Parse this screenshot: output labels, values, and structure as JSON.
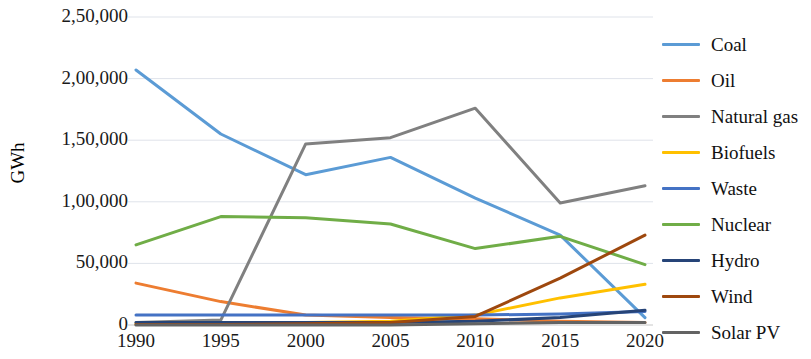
{
  "chart_data": {
    "type": "line",
    "title": "",
    "xlabel": "",
    "ylabel": "GWh",
    "x": [
      1990,
      1995,
      2000,
      2005,
      2010,
      2015,
      2020
    ],
    "xtick_labels": [
      "1990",
      "1995",
      "2000",
      "2005",
      "2010",
      "2015",
      "2020"
    ],
    "ytick_labels": [
      "0",
      "50,000",
      "1,00,000",
      "1,50,000",
      "2,00,000",
      "2,50,000"
    ],
    "ytick_values": [
      0,
      50000,
      100000,
      150000,
      200000,
      250000
    ],
    "ylim": [
      0,
      250000
    ],
    "grid": true,
    "legend_position": "right",
    "series": [
      {
        "name": "Coal",
        "color": "#5b9bd5",
        "values": [
          207000,
          155000,
          122000,
          136000,
          103000,
          73000,
          6000
        ]
      },
      {
        "name": "Oil",
        "color": "#ed7d31",
        "values": [
          34000,
          19000,
          8000,
          6000,
          5000,
          3000,
          2000
        ]
      },
      {
        "name": "Natural gas",
        "color": "#808080",
        "values": [
          2000,
          4000,
          147000,
          152000,
          176000,
          99000,
          113000
        ]
      },
      {
        "name": "Biofuels",
        "color": "#ffc000",
        "values": [
          1000,
          1000,
          2000,
          3000,
          8000,
          22000,
          33000
        ]
      },
      {
        "name": "Waste",
        "color": "#4472c4",
        "values": [
          8000,
          8000,
          8000,
          8000,
          8000,
          9000,
          11000
        ]
      },
      {
        "name": "Nuclear",
        "color": "#70ad47",
        "values": [
          65000,
          88000,
          87000,
          82000,
          62000,
          72000,
          49000
        ]
      },
      {
        "name": "Hydro",
        "color": "#264478",
        "values": [
          2000,
          2000,
          2000,
          2000,
          3000,
          6000,
          12000
        ]
      },
      {
        "name": "Wind",
        "color": "#9e480e",
        "values": [
          500,
          500,
          1000,
          2000,
          7000,
          38000,
          73000
        ]
      },
      {
        "name": "Solar PV",
        "color": "#636363",
        "values": [
          0,
          0,
          0,
          0,
          1000,
          2000,
          2000
        ]
      }
    ]
  },
  "legend": {
    "items": [
      {
        "label": "Coal"
      },
      {
        "label": "Oil"
      },
      {
        "label": "Natural gas"
      },
      {
        "label": "Biofuels"
      },
      {
        "label": "Waste"
      },
      {
        "label": "Nuclear"
      },
      {
        "label": "Hydro"
      },
      {
        "label": "Wind"
      },
      {
        "label": "Solar PV"
      }
    ]
  }
}
